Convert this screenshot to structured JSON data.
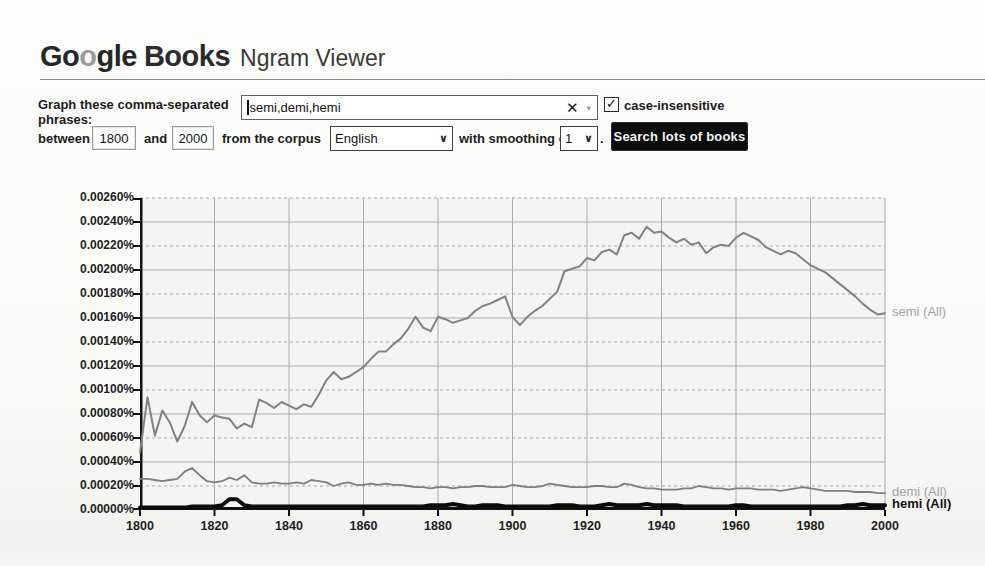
{
  "header": {
    "logo_part1": "Go",
    "logo_part2": "o",
    "logo_part3": "gle",
    "logo_books": "Books",
    "logo_suffix": "Ngram Viewer"
  },
  "form": {
    "graph_label_line1": "Graph these comma-separated",
    "graph_label_line2": "phrases:",
    "phrases_value": "semi,demi,hemi",
    "clear_icon": "✕",
    "combo_arrow_icon": "▾",
    "case_insensitive_checked": true,
    "check_icon": "✓",
    "case_insensitive_label": "case-insensitive",
    "between_label": "between",
    "start_year": "1800",
    "and_label": "and",
    "end_year": "2000",
    "corpus_label": "from the corpus",
    "corpus_value": "English",
    "smoothing_label": "with smoothing of",
    "smoothing_value": "1",
    "chevron_icon": "∨",
    "period_after_smoothing": ".",
    "search_button_label": "Search lots of books"
  },
  "chart_data": {
    "type": "line",
    "title": "",
    "xlabel": "",
    "ylabel": "",
    "xlim": [
      1800,
      2000
    ],
    "ylim_percent": [
      0,
      0.0026
    ],
    "grid": true,
    "legend_position": "right-of-line-end",
    "x_ticks": [
      1800,
      1820,
      1840,
      1860,
      1880,
      1900,
      1920,
      1940,
      1960,
      1980,
      2000
    ],
    "y_tick_labels": [
      "0.00260%",
      "0.00240%",
      "0.00220%",
      "0.00200%",
      "0.00180%",
      "0.00160%",
      "0.00140%",
      "0.00120%",
      "0.00100%",
      "0.00080%",
      "0.00060%",
      "0.00040%",
      "0.00020%",
      "0.00000%"
    ],
    "grid_color": "#ababab",
    "axis_color": "#111111",
    "years": [
      1800,
      1802,
      1804,
      1806,
      1808,
      1810,
      1812,
      1814,
      1816,
      1818,
      1820,
      1822,
      1824,
      1826,
      1828,
      1830,
      1832,
      1834,
      1836,
      1838,
      1840,
      1842,
      1844,
      1846,
      1848,
      1850,
      1852,
      1854,
      1856,
      1858,
      1860,
      1862,
      1864,
      1866,
      1868,
      1870,
      1872,
      1874,
      1876,
      1878,
      1880,
      1882,
      1884,
      1886,
      1888,
      1890,
      1892,
      1894,
      1896,
      1898,
      1900,
      1902,
      1904,
      1906,
      1908,
      1910,
      1912,
      1914,
      1916,
      1918,
      1920,
      1922,
      1924,
      1926,
      1928,
      1930,
      1932,
      1934,
      1936,
      1938,
      1940,
      1942,
      1944,
      1946,
      1948,
      1950,
      1952,
      1954,
      1956,
      1958,
      1960,
      1962,
      1964,
      1966,
      1968,
      1970,
      1972,
      1974,
      1976,
      1978,
      1980,
      1982,
      1984,
      1986,
      1988,
      1990,
      1992,
      1994,
      1996,
      1998,
      2000
    ],
    "series": [
      {
        "key": "semi",
        "label": "semi (All)",
        "color": "#828282",
        "stroke_width": 2,
        "label_color": "#a2a2a2",
        "label_bold": false,
        "values": [
          0.00048,
          0.00094,
          0.00062,
          0.00083,
          0.00073,
          0.00057,
          0.0007,
          0.0009,
          0.00079,
          0.00073,
          0.00079,
          0.00077,
          0.00076,
          0.00068,
          0.00072,
          0.00069,
          0.00092,
          0.00089,
          0.00085,
          0.0009,
          0.00087,
          0.00084,
          0.00088,
          0.00086,
          0.00096,
          0.00108,
          0.00115,
          0.00109,
          0.00111,
          0.00115,
          0.00119,
          0.00126,
          0.00132,
          0.00132,
          0.00138,
          0.00143,
          0.00151,
          0.00161,
          0.00152,
          0.00149,
          0.00161,
          0.00159,
          0.00156,
          0.00158,
          0.0016,
          0.00166,
          0.0017,
          0.00172,
          0.00175,
          0.00178,
          0.00161,
          0.00154,
          0.00161,
          0.00166,
          0.0017,
          0.00176,
          0.00182,
          0.00199,
          0.00201,
          0.00203,
          0.0021,
          0.00208,
          0.00215,
          0.00217,
          0.00213,
          0.00229,
          0.00231,
          0.00226,
          0.00236,
          0.00231,
          0.00232,
          0.00227,
          0.00223,
          0.00226,
          0.00221,
          0.00223,
          0.00214,
          0.00219,
          0.00221,
          0.0022,
          0.00227,
          0.00231,
          0.00228,
          0.00225,
          0.00219,
          0.00216,
          0.00213,
          0.00216,
          0.00214,
          0.00209,
          0.00204,
          0.00201,
          0.00198,
          0.00193,
          0.00188,
          0.00183,
          0.00178,
          0.00172,
          0.00167,
          0.00163,
          0.00164
        ]
      },
      {
        "key": "demi",
        "label": "demi (All)",
        "color": "#7e7e7e",
        "stroke_width": 1.8,
        "label_color": "#a2a2a2",
        "label_bold": false,
        "values": [
          0.00026,
          0.00026,
          0.00025,
          0.00024,
          0.00025,
          0.00026,
          0.00032,
          0.00035,
          0.00029,
          0.00024,
          0.00023,
          0.00024,
          0.00027,
          0.00025,
          0.00029,
          0.00023,
          0.00022,
          0.00022,
          0.00023,
          0.00022,
          0.00022,
          0.00023,
          0.00022,
          0.00025,
          0.00024,
          0.00023,
          0.0002,
          0.00022,
          0.00023,
          0.00021,
          0.00021,
          0.00022,
          0.00021,
          0.00022,
          0.00021,
          0.00021,
          0.0002,
          0.00019,
          0.00019,
          0.00018,
          0.00019,
          0.00019,
          0.00018,
          0.00019,
          0.00019,
          0.0002,
          0.0002,
          0.00019,
          0.00019,
          0.00019,
          0.00021,
          0.0002,
          0.00019,
          0.00019,
          0.0002,
          0.00022,
          0.00021,
          0.0002,
          0.00019,
          0.00019,
          0.00019,
          0.0002,
          0.0002,
          0.00019,
          0.00019,
          0.00022,
          0.00021,
          0.00019,
          0.00018,
          0.00018,
          0.00017,
          0.00017,
          0.00017,
          0.00018,
          0.00018,
          0.0002,
          0.00019,
          0.00018,
          0.00018,
          0.00017,
          0.00018,
          0.00018,
          0.00018,
          0.00017,
          0.00017,
          0.00017,
          0.00016,
          0.00017,
          0.00018,
          0.00019,
          0.00018,
          0.00017,
          0.00016,
          0.00016,
          0.00016,
          0.00016,
          0.00015,
          0.00015,
          0.00015,
          0.00014,
          0.00014
        ]
      },
      {
        "key": "hemi",
        "label": "hemi (All)",
        "color": "#0a0a0a",
        "stroke_width": 4,
        "label_color": "#141414",
        "label_bold": true,
        "values": [
          2e-05,
          2e-05,
          2e-05,
          2e-05,
          2e-05,
          2e-05,
          2e-05,
          3e-05,
          3e-05,
          3e-05,
          3e-05,
          4e-05,
          9e-05,
          9e-05,
          4e-05,
          3e-05,
          3e-05,
          3e-05,
          3e-05,
          3e-05,
          3e-05,
          3e-05,
          3e-05,
          3e-05,
          3e-05,
          3e-05,
          3e-05,
          3e-05,
          3e-05,
          3e-05,
          3e-05,
          3e-05,
          3e-05,
          3e-05,
          3e-05,
          3e-05,
          3e-05,
          3e-05,
          3e-05,
          4e-05,
          4e-05,
          4e-05,
          5e-05,
          4e-05,
          3e-05,
          3e-05,
          4e-05,
          4e-05,
          4e-05,
          3e-05,
          3e-05,
          3e-05,
          3e-05,
          3e-05,
          3e-05,
          3e-05,
          4e-05,
          4e-05,
          4e-05,
          3e-05,
          3e-05,
          3e-05,
          4e-05,
          5e-05,
          4e-05,
          4e-05,
          4e-05,
          4e-05,
          5e-05,
          4e-05,
          4e-05,
          4e-05,
          4e-05,
          3e-05,
          3e-05,
          3e-05,
          3e-05,
          3e-05,
          3e-05,
          3e-05,
          4e-05,
          4e-05,
          3e-05,
          3e-05,
          3e-05,
          3e-05,
          3e-05,
          3e-05,
          3e-05,
          3e-05,
          3e-05,
          3e-05,
          3e-05,
          3e-05,
          3e-05,
          4e-05,
          4e-05,
          5e-05,
          4e-05,
          4e-05,
          4e-05
        ]
      }
    ]
  }
}
